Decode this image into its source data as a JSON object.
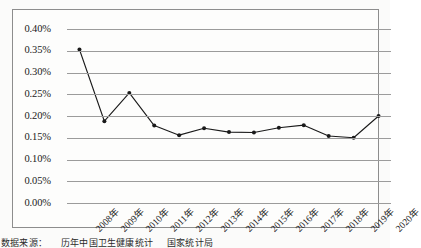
{
  "chart_data": {
    "type": "line",
    "title": "",
    "subtitle": "",
    "xlabel": "",
    "ylabel": "",
    "categories": [
      "2008年",
      "2009年",
      "2010年",
      "2011年",
      "2012年",
      "2013年",
      "2014年",
      "2015年",
      "2016年",
      "2017年",
      "2018年",
      "2019年",
      "2020年"
    ],
    "values": [
      0.353,
      0.188,
      0.253,
      0.178,
      0.156,
      0.172,
      0.163,
      0.162,
      0.173,
      0.179,
      0.154,
      0.15,
      0.2
    ],
    "unit": "%",
    "ylim": [
      0.0,
      0.4
    ],
    "ytick_values": [
      0.4,
      0.35,
      0.3,
      0.25,
      0.2,
      0.15,
      0.1,
      0.05,
      0.0
    ],
    "ytick_labels": [
      "0.40%",
      "0.35%",
      "0.30%",
      "0.25%",
      "0.20%",
      "0.15%",
      "0.10%",
      "0.05%",
      "0.00%"
    ],
    "grid": true,
    "legend": "none",
    "series_color": "#1a1a1a",
    "gridline_color": "#9b9b9b",
    "marker": "square-dot",
    "xtick_rotation": -45
  },
  "caption": {
    "segments": [
      "数据来源：",
      "历年中国卫生健康统计",
      "国家统计局"
    ]
  }
}
